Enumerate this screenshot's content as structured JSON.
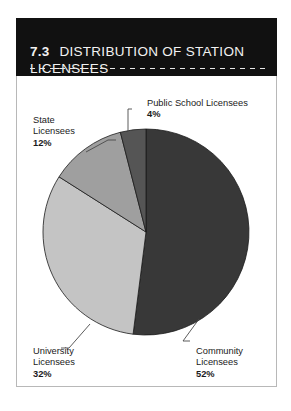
{
  "figure": {
    "number": "7.3",
    "title": "DISTRIBUTION OF STATION LICENSEES",
    "header_line1": "DISTRIBUTION OF STATION",
    "header_line2": "LICENSEES"
  },
  "labels": {
    "public_school": {
      "name": "Public School Licensees",
      "value": "4%"
    },
    "state": {
      "name": "State\nLicensees",
      "value": "12%"
    },
    "university": {
      "name": "University\nLicensees",
      "value": "32%"
    },
    "community": {
      "name": "Community\nLicensees",
      "value": "52%"
    }
  },
  "colors": {
    "header_bg": "#111111",
    "community": "#383838",
    "public_school": "#555555",
    "state": "#9f9f9f",
    "university": "#c4c4c4",
    "slice_stroke": "#1a1a1a",
    "frame_border": "#b8b8b8"
  },
  "chart_data": {
    "type": "pie",
    "xlabel": "",
    "ylabel": "",
    "legend_position": "callout-labels",
    "grid": false,
    "start_angle_deg": 0,
    "direction": "clockwise",
    "categories": [
      "Community Licensees",
      "University Licensees",
      "State Licensees",
      "Public School Licensees"
    ],
    "values": [
      52,
      32,
      12,
      4
    ],
    "value_labels": [
      "52%",
      "32%",
      "12%",
      "4%"
    ],
    "slice_colors": [
      "#383838",
      "#c4c4c4",
      "#9f9f9f",
      "#555555"
    ],
    "units": "percent",
    "total": 100
  }
}
